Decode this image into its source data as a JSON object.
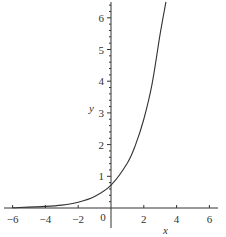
{
  "chart_data": {
    "type": "line",
    "title": "",
    "xlabel": "x",
    "ylabel": "y",
    "xlim": [
      -6.5,
      6.5
    ],
    "ylim": [
      0,
      6.5
    ],
    "grid": false,
    "legend": null,
    "x_ticks": [
      -6,
      -4,
      -2,
      0,
      2,
      4,
      6
    ],
    "x_tick_labels": [
      "−6",
      "−4",
      "−2",
      "0",
      "2",
      "4",
      "6"
    ],
    "y_ticks": [
      1,
      2,
      3,
      4,
      5,
      6
    ],
    "y_tick_labels": [
      "1",
      "2",
      "3",
      "4",
      "5",
      "6"
    ],
    "series": [
      {
        "name": "exponential curve",
        "color": "#333333",
        "x": [
          -6,
          -4,
          -3,
          -2,
          -1,
          0,
          1,
          1.5,
          2,
          2.5,
          3,
          3.35
        ],
        "y": [
          0.01,
          0.05,
          0.09,
          0.18,
          0.36,
          0.72,
          1.42,
          2.0,
          2.8,
          3.9,
          5.5,
          6.5
        ]
      }
    ]
  },
  "axes_style": {
    "axis_color": "#333333",
    "curve_color": "#333333",
    "background": "#ffffff"
  }
}
